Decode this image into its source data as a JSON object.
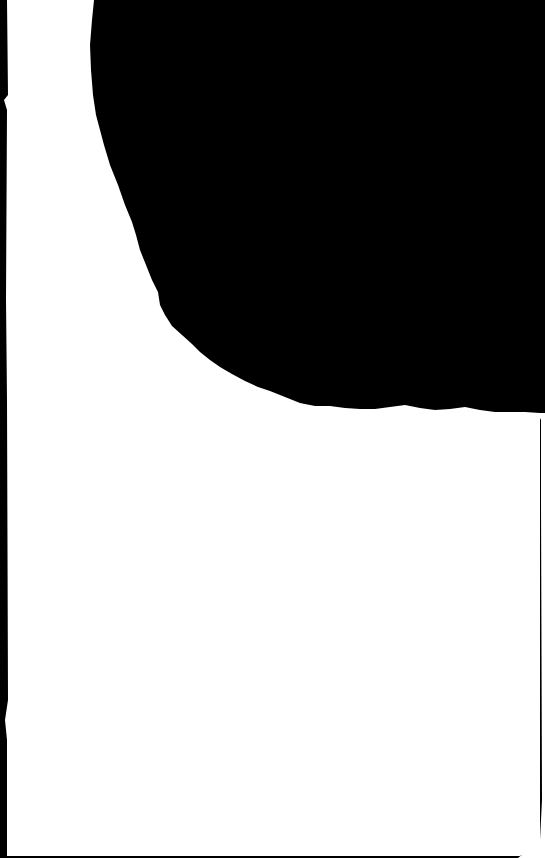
{
  "image": {
    "description": "Torn white paper sheet against black background",
    "width": 545,
    "height": 858
  },
  "colors": {
    "background": "#000000",
    "paper": "#ffffff"
  },
  "regions": [
    {
      "name": "paper-sheet",
      "color": "#ffffff"
    },
    {
      "name": "torn-black-region-top-right",
      "color": "#000000"
    },
    {
      "name": "left-black-strip",
      "color": "#000000"
    }
  ]
}
